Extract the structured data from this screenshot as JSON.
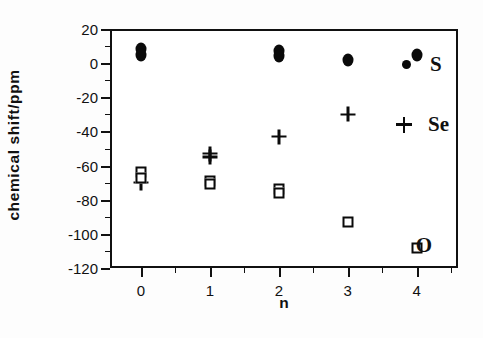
{
  "figure": {
    "background_color": "#ffffff",
    "ink_color": "#111111"
  },
  "chart_data": {
    "type": "scatter",
    "title": "",
    "subtitle": "",
    "xlabel": "n",
    "ylabel": "chemical  shift/ppm",
    "xlim": [
      -0.45,
      4.6
    ],
    "ylim": [
      -120,
      20
    ],
    "xticks": [
      0,
      1,
      2,
      3,
      4
    ],
    "xtick_labels": [
      "0",
      "1",
      "2",
      "3",
      "4"
    ],
    "yticks": [
      20,
      0,
      -20,
      -40,
      -60,
      -80,
      -100,
      -120
    ],
    "ytick_labels": [
      "20",
      "0",
      "-20",
      "-40",
      "-60",
      "-80",
      "-100",
      "-120"
    ],
    "x_minor_ticks_between": 1,
    "y_minor_ticks_between": 1,
    "grid": false,
    "legend_position": "right-inside",
    "series": [
      {
        "name": "S",
        "marker": "filled-circle",
        "color": "#0a0a0a",
        "points": [
          {
            "x": 0,
            "y": 8
          },
          {
            "x": 0,
            "y": 5
          },
          {
            "x": 2,
            "y": 7
          },
          {
            "x": 2,
            "y": 4
          },
          {
            "x": 3,
            "y": 2
          },
          {
            "x": 4,
            "y": 5
          }
        ]
      },
      {
        "name": "Se",
        "marker": "plus",
        "color": "#0a0a0a",
        "points": [
          {
            "x": 0,
            "y": -70
          },
          {
            "x": 1,
            "y": -53
          },
          {
            "x": 1,
            "y": -55
          },
          {
            "x": 2,
            "y": -43
          },
          {
            "x": 3,
            "y": -30
          }
        ]
      },
      {
        "name": "O",
        "marker": "open-square",
        "color": "#0a0a0a",
        "points": [
          {
            "x": 0,
            "y": -64
          },
          {
            "x": 0,
            "y": -67
          },
          {
            "x": 1,
            "y": -69
          },
          {
            "x": 1,
            "y": -71
          },
          {
            "x": 2,
            "y": -74
          },
          {
            "x": 2,
            "y": -76
          },
          {
            "x": 3,
            "y": -93
          },
          {
            "x": 4,
            "y": -108
          }
        ]
      }
    ],
    "annotations": [
      {
        "text": "O",
        "x": 4.58,
        "y": -107
      }
    ]
  },
  "legend": {
    "entries": [
      {
        "label": "S",
        "marker": "filled-circle"
      },
      {
        "label": "Se",
        "marker": "plus"
      }
    ]
  },
  "annotation_O": {
    "label": "O"
  }
}
